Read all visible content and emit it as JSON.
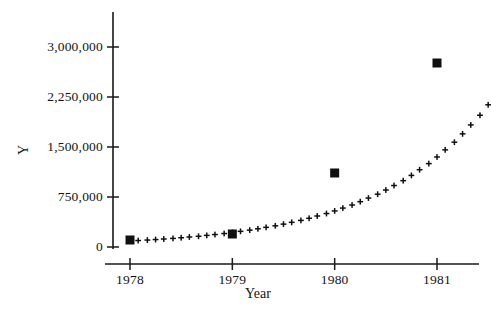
{
  "chart_data": {
    "type": "scatter",
    "title": "",
    "xlabel": "Year",
    "ylabel": "Y",
    "xlim": [
      1977.75,
      1981.6
    ],
    "ylim": [
      0,
      3450000
    ],
    "grid": false,
    "legend": "none",
    "x_ticks": [
      1978,
      1979,
      1980,
      1981
    ],
    "x_tick_labels": [
      "1978",
      "1979",
      "1980",
      "1981"
    ],
    "y_ticks": [
      0,
      750000,
      1500000,
      2250000,
      3000000
    ],
    "y_tick_labels": [
      "0",
      "750,000",
      "1,500,000",
      "2,250,000",
      "3,000,000"
    ],
    "series": [
      {
        "name": "fitted",
        "marker": "plus",
        "color": "#101010",
        "points": [
          {
            "x": 1978.0,
            "y": 90000
          },
          {
            "x": 1978.08,
            "y": 97000
          },
          {
            "x": 1978.17,
            "y": 104000
          },
          {
            "x": 1978.25,
            "y": 112000
          },
          {
            "x": 1978.33,
            "y": 120000
          },
          {
            "x": 1978.42,
            "y": 129000
          },
          {
            "x": 1978.5,
            "y": 139000
          },
          {
            "x": 1978.58,
            "y": 150000
          },
          {
            "x": 1978.67,
            "y": 161000
          },
          {
            "x": 1978.75,
            "y": 174000
          },
          {
            "x": 1978.83,
            "y": 187000
          },
          {
            "x": 1978.92,
            "y": 202000
          },
          {
            "x": 1979.0,
            "y": 218000
          },
          {
            "x": 1979.08,
            "y": 235000
          },
          {
            "x": 1979.17,
            "y": 253000
          },
          {
            "x": 1979.25,
            "y": 273000
          },
          {
            "x": 1979.33,
            "y": 295000
          },
          {
            "x": 1979.42,
            "y": 318000
          },
          {
            "x": 1979.5,
            "y": 343000
          },
          {
            "x": 1979.58,
            "y": 370000
          },
          {
            "x": 1979.67,
            "y": 399000
          },
          {
            "x": 1979.75,
            "y": 431000
          },
          {
            "x": 1979.83,
            "y": 465000
          },
          {
            "x": 1979.92,
            "y": 502000
          },
          {
            "x": 1980.0,
            "y": 541000
          },
          {
            "x": 1980.08,
            "y": 584000
          },
          {
            "x": 1980.17,
            "y": 630000
          },
          {
            "x": 1980.25,
            "y": 680000
          },
          {
            "x": 1980.33,
            "y": 734000
          },
          {
            "x": 1980.42,
            "y": 792000
          },
          {
            "x": 1980.5,
            "y": 855000
          },
          {
            "x": 1980.58,
            "y": 922000
          },
          {
            "x": 1980.67,
            "y": 995000
          },
          {
            "x": 1980.75,
            "y": 1074000
          },
          {
            "x": 1980.83,
            "y": 1159000
          },
          {
            "x": 1980.92,
            "y": 1251000
          },
          {
            "x": 1981.0,
            "y": 1350000
          },
          {
            "x": 1981.08,
            "y": 1457000
          },
          {
            "x": 1981.17,
            "y": 1572000
          },
          {
            "x": 1981.25,
            "y": 1697000
          },
          {
            "x": 1981.33,
            "y": 1831000
          },
          {
            "x": 1981.42,
            "y": 1976000
          },
          {
            "x": 1981.5,
            "y": 2133000
          }
        ]
      },
      {
        "name": "observed",
        "marker": "square",
        "color": "#101010",
        "points": [
          {
            "x": 1978,
            "y": 105000
          },
          {
            "x": 1979,
            "y": 195000
          },
          {
            "x": 1980,
            "y": 1110000
          },
          {
            "x": 1981,
            "y": 2760000
          }
        ]
      }
    ]
  },
  "axis": {
    "y_title": "Y",
    "x_title": "Year"
  }
}
